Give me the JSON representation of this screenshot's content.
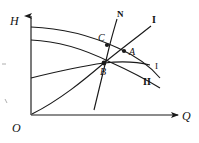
{
  "figure": {
    "type": "line-diagram",
    "background_color": "#ffffff",
    "line_color": "#1a1a1a",
    "axes": {
      "y_label": "H",
      "x_label": "Q",
      "origin_label": "O",
      "y_axis": {
        "x": 31,
        "top": 14,
        "bottom": 115,
        "arrow": true
      },
      "x_axis": {
        "y": 115,
        "left": 31,
        "right": 180,
        "arrow": true
      }
    },
    "points": [
      {
        "name": "A",
        "label": "A",
        "x": 124,
        "y": 51,
        "marker": "dot"
      },
      {
        "name": "B",
        "label": "B",
        "x": 104,
        "y": 63,
        "marker": "dot"
      },
      {
        "name": "C",
        "label": "C",
        "x": 107,
        "y": 45,
        "marker": "dot"
      }
    ],
    "curves": [
      {
        "name": "curve-I-upper",
        "label": "I",
        "label_style": "bold",
        "path": "M31,27 C 60,28 92,36 118,48 C 136,56 150,66 160,78",
        "label_position": {
          "x": 152,
          "y": 15
        }
      },
      {
        "name": "curve-I-middle",
        "label": "I",
        "label_style": "regular",
        "path": "M31,40 C 58,41 86,50 110,62 C 130,71 147,80 160,88",
        "label_position": {
          "x": 155,
          "y": 62
        }
      },
      {
        "name": "curve-II-lower",
        "label": "II",
        "label_style": "bold",
        "path": "M31,78 C 55,72 82,66 104,63 C 122,61 138,62 150,65",
        "label_position": {
          "x": 143,
          "y": 77
        }
      },
      {
        "name": "curve-N-system",
        "label": "N",
        "label_style": "bold-italic",
        "path": "M94,110 C 99,90 104,68 109,48 C 112,36 115,26 117,19",
        "label_position": {
          "x": 117,
          "y": 10
        }
      },
      {
        "name": "curve-efficiency-rising",
        "label": "",
        "label_style": "none",
        "path": "M32,114 C 60,100 84,80 104,63 C 120,50 136,38 151,26",
        "label_position": null
      }
    ],
    "tick_marks": [
      {
        "name": "left-edge-tick-upper",
        "x": 3,
        "y": 64
      },
      {
        "name": "left-edge-tick-lower",
        "x": 6,
        "y": 101
      }
    ]
  }
}
